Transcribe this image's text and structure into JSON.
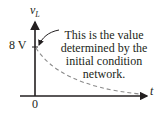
{
  "diagram": {
    "y_axis_label": "v",
    "y_axis_subscript": "L",
    "x_axis_label": "t",
    "origin_label": "0",
    "y_tick_label": "8 V",
    "annotation_lines": [
      "This is the value",
      "determined by the",
      "initial condition",
      "network."
    ],
    "curve": "dashed exponential decay from 8 V toward 0",
    "colors": {
      "axis": "#231f20",
      "curve": "#8c8c8c",
      "text": "#231f20"
    }
  }
}
